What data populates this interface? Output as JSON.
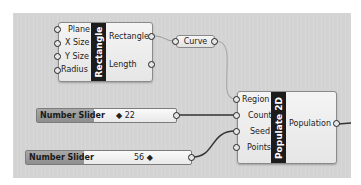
{
  "canvas": {
    "background": "#d3d3d3"
  },
  "rectangle_component": {
    "title": "Rectangle",
    "inputs": [
      "Plane",
      "X Size",
      "Y Size",
      "Radius"
    ],
    "outputs": [
      "Rectangle",
      "Length"
    ]
  },
  "curve_param": {
    "label": "Curve"
  },
  "populate_component": {
    "title": "Populate 2D",
    "inputs": [
      "Region",
      "Count",
      "Seed",
      "Points"
    ],
    "outputs": [
      "Population"
    ]
  },
  "sliders": [
    {
      "label": "Number Slider",
      "value": "◆ 22"
    },
    {
      "label": "Number Slider",
      "value": "56 ◆"
    }
  ]
}
